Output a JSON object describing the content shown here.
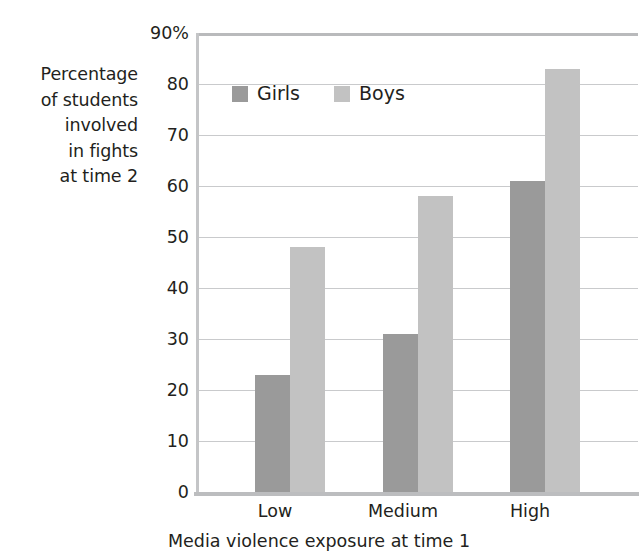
{
  "chart_data": {
    "type": "bar",
    "title": "",
    "subtitle": "",
    "xlabel": "Media violence exposure at time 1",
    "ylabel": "Percentage of students involved in fights at time 2",
    "ylabel_lines": [
      "Percentage",
      "of students",
      "involved",
      "in fights",
      "at time 2"
    ],
    "categories": [
      "Low",
      "Medium",
      "High"
    ],
    "series": [
      {
        "name": "Girls",
        "values": [
          23,
          31,
          61
        ],
        "color": "#9a9a9a"
      },
      {
        "name": "Boys",
        "values": [
          48,
          58,
          83
        ],
        "color": "#c2c2c2"
      }
    ],
    "ylim": [
      0,
      90
    ],
    "ytick_values": [
      0,
      10,
      20,
      30,
      40,
      50,
      60,
      70,
      80,
      90
    ],
    "ytick_labels": [
      "0",
      "10",
      "20",
      "30",
      "40",
      "50",
      "60",
      "70",
      "80",
      "90%"
    ],
    "grid": true,
    "grid_axis": "y",
    "legend": {
      "position": "inside-top-left",
      "entries": [
        "Girls",
        "Boys"
      ]
    },
    "annotations": []
  },
  "legend": {
    "girls_label": "Girls",
    "boys_label": "Boys"
  },
  "axes": {
    "x_title": "Media violence exposure at time 1",
    "y_caption": {
      "line1": "Percentage",
      "line2": "of students",
      "line3": "involved",
      "line4": "in fights",
      "line5": "at time 2"
    },
    "x_categories": {
      "low": "Low",
      "medium": "Medium",
      "high": "High"
    },
    "y_labels": {
      "t90": "90%",
      "t80": "80",
      "t70": "70",
      "t60": "60",
      "t50": "50",
      "t40": "40",
      "t30": "30",
      "t20": "20",
      "t10": "10",
      "t0": "0"
    }
  },
  "colors": {
    "girls": "#9a9a9a",
    "boys": "#c2c2c2",
    "gridline": "#c9cacc",
    "axis": "#bcbdbf",
    "text": "#231f20"
  }
}
